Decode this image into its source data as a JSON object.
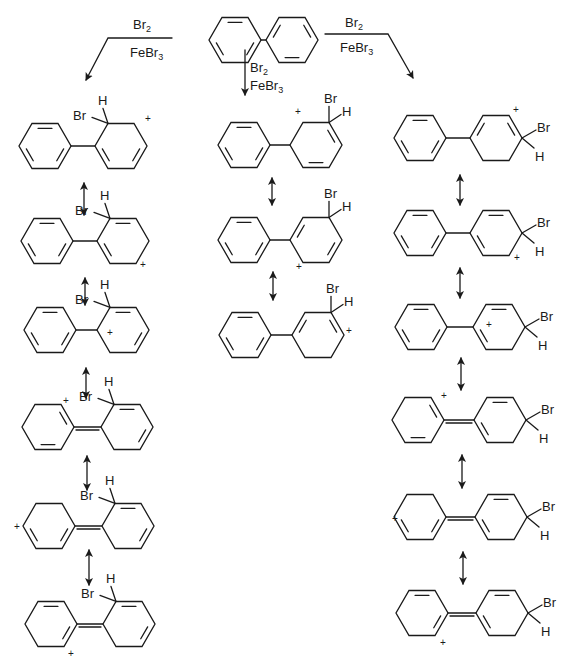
{
  "reagents": {
    "reagent1": "Br",
    "reagent1_sub": "2",
    "catalyst": "FeBr",
    "catalyst_sub": "3"
  },
  "atoms": {
    "bromine": "Br",
    "hydrogen": "H",
    "charge": "+"
  },
  "starting_material": {
    "name": "biphenyl",
    "left_ring": [
      235,
      40
    ],
    "right_ring": [
      292,
      40
    ]
  },
  "columns": [
    {
      "name": "ortho",
      "structures": [
        {
          "left": [
            45,
            146
          ],
          "right": [
            121,
            146
          ],
          "link": "single",
          "leftDbl": [
            0,
            2,
            4
          ],
          "rightDbl": [
            2,
            4
          ],
          "sp3": 5,
          "brSide": "ortho",
          "plus": [
            145,
            122
          ]
        },
        {
          "left": [
            47,
            241
          ],
          "right": [
            123,
            241
          ],
          "link": "single",
          "leftDbl": [
            0,
            2,
            4
          ],
          "rightDbl": [
            0,
            4
          ],
          "sp3": 5,
          "brSide": "ortho",
          "plus": [
            140,
            268
          ]
        },
        {
          "left": [
            50,
            330
          ],
          "right": [
            123,
            330
          ],
          "link": "single",
          "leftDbl": [
            0,
            2,
            4
          ],
          "rightDbl": [
            0,
            2
          ],
          "sp3": 5,
          "brSide": "ortho",
          "plus": [
            107,
            336
          ]
        },
        {
          "left": [
            48,
            427
          ],
          "right": [
            127,
            427
          ],
          "link": "double",
          "leftDbl": [
            3,
            1
          ],
          "rightDbl": [
            0,
            2
          ],
          "sp3": 5,
          "brSide": "ortho",
          "plus": [
            63,
            404
          ]
        },
        {
          "left": [
            49,
            526
          ],
          "right": [
            128,
            526
          ],
          "link": "double",
          "leftDbl": [
            2,
            4
          ],
          "rightDbl": [
            0,
            2
          ],
          "sp3": 5,
          "brSide": "ortho",
          "plus": [
            14,
            530
          ]
        },
        {
          "left": [
            51,
            624
          ],
          "right": [
            129,
            624
          ],
          "link": "double",
          "leftDbl": [
            2,
            0
          ],
          "rightDbl": [
            0,
            2
          ],
          "sp3": 5,
          "brSide": "ortho",
          "plus": [
            68,
            657
          ]
        }
      ]
    },
    {
      "name": "meta",
      "structures": [
        {
          "left": [
            244,
            145
          ],
          "right": [
            316,
            145
          ],
          "link": "single",
          "leftDbl": [
            0,
            2,
            4
          ],
          "rightDbl": [
            1,
            3
          ],
          "sp3": 4,
          "brSide": "meta",
          "plus": [
            295,
            115
          ]
        },
        {
          "left": [
            244,
            240
          ],
          "right": [
            316,
            240
          ],
          "link": "single",
          "leftDbl": [
            0,
            2,
            4
          ],
          "rightDbl": [
            5,
            2
          ],
          "sp3": 4,
          "brSide": "meta",
          "plus": [
            296,
            270
          ]
        },
        {
          "left": [
            245,
            335
          ],
          "right": [
            318,
            335
          ],
          "link": "single",
          "leftDbl": [
            0,
            2,
            4
          ],
          "rightDbl": [
            5,
            1
          ],
          "sp3": 4,
          "brSide": "meta",
          "plus": [
            346,
            334
          ]
        }
      ]
    },
    {
      "name": "para",
      "structures": [
        {
          "left": [
            420,
            138
          ],
          "right": [
            496,
            138
          ],
          "link": "single",
          "leftDbl": [
            0,
            2,
            4
          ],
          "rightDbl": [
            5,
            1
          ],
          "sp3": 3,
          "brSide": "para",
          "plus": [
            513,
            113
          ]
        },
        {
          "left": [
            420,
            233
          ],
          "right": [
            496,
            233
          ],
          "link": "single",
          "leftDbl": [
            0,
            2,
            4
          ],
          "rightDbl": [
            4,
            0
          ],
          "sp3": 3,
          "brSide": "para",
          "plus": [
            514,
            261
          ]
        },
        {
          "left": [
            421,
            327
          ],
          "right": [
            499,
            327
          ],
          "link": "single",
          "leftDbl": [
            0,
            2,
            4
          ],
          "rightDbl": [
            4,
            0
          ],
          "sp3": 3,
          "brSide": "para",
          "plus": [
            486,
            328
          ]
        },
        {
          "left": [
            418,
            420
          ],
          "right": [
            500,
            420
          ],
          "link": "double",
          "leftDbl": [
            3,
            1
          ],
          "rightDbl": [
            4,
            0
          ],
          "sp3": 3,
          "brSide": "para",
          "plus": [
            441,
            399
          ]
        },
        {
          "left": [
            420,
            517
          ],
          "right": [
            501,
            517
          ],
          "link": "double",
          "leftDbl": [
            2,
            4
          ],
          "rightDbl": [
            4,
            0
          ],
          "sp3": 3,
          "brSide": "para",
          "plus": [
            392,
            522
          ]
        },
        {
          "left": [
            422,
            613
          ],
          "right": [
            502,
            613
          ],
          "link": "double",
          "leftDbl": [
            2,
            0
          ],
          "rightDbl": [
            4,
            0
          ],
          "sp3": 3,
          "brSide": "para",
          "plus": [
            440,
            646
          ]
        }
      ]
    }
  ],
  "resonance_arrows": [
    [
      84,
      183,
      84,
      215
    ],
    [
      85,
      278,
      85,
      305
    ],
    [
      86,
      368,
      86,
      398
    ],
    [
      87,
      456,
      87,
      490
    ],
    [
      89,
      550,
      89,
      585
    ],
    [
      272,
      178,
      272,
      205
    ],
    [
      273,
      272,
      273,
      300
    ],
    [
      460,
      175,
      460,
      205
    ],
    [
      460,
      268,
      460,
      298
    ],
    [
      461,
      358,
      461,
      390
    ],
    [
      462,
      455,
      462,
      488
    ],
    [
      463,
      552,
      463,
      584
    ]
  ],
  "reaction_arrows": {
    "left": {
      "path": [
        [
          172,
          38
        ],
        [
          108,
          38
        ],
        [
          86,
          80
        ]
      ],
      "label_top": [
        133,
        29
      ],
      "label_bottom": [
        130,
        57
      ]
    },
    "middle": {
      "path": [
        [
          245,
          50
        ],
        [
          245,
          95
        ]
      ],
      "label_top": [
        250,
        72
      ],
      "label_bottom": [
        250,
        90
      ]
    },
    "right": {
      "path": [
        [
          325,
          34
        ],
        [
          388,
          34
        ],
        [
          413,
          78
        ]
      ],
      "label_top": [
        345,
        27
      ],
      "label_bottom": [
        340,
        52
      ]
    }
  }
}
